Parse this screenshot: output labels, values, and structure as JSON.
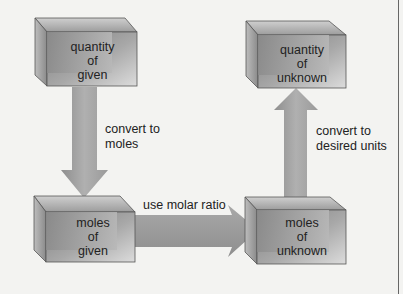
{
  "diagram": {
    "type": "flowchart",
    "nodes": [
      {
        "id": "quantity_given",
        "line1": "quantity",
        "line2": "of",
        "line3": "given"
      },
      {
        "id": "moles_given",
        "line1": "moles",
        "line2": "of",
        "line3": "given"
      },
      {
        "id": "moles_unknown",
        "line1": "moles",
        "line2": "of",
        "line3": "unknown"
      },
      {
        "id": "quantity_unknown",
        "line1": "quantity",
        "line2": "of",
        "line3": "unknown"
      }
    ],
    "edges": [
      {
        "from": "quantity_given",
        "to": "moles_given",
        "line1": "convert to",
        "line2": "moles"
      },
      {
        "from": "moles_given",
        "to": "moles_unknown",
        "line1": "use molar ratio"
      },
      {
        "from": "moles_unknown",
        "to": "quantity_unknown",
        "line1": "convert to",
        "line2": "desired units"
      }
    ]
  },
  "colors": {
    "background": "#f3f3f1",
    "arrow": "#9a9a9a",
    "box_front": "#8f8f8f",
    "box_light": "#d8d8d8",
    "text": "#222222"
  }
}
